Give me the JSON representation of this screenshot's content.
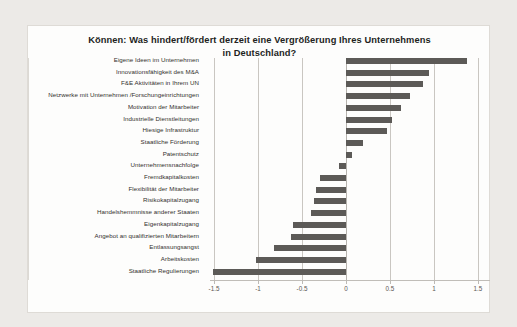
{
  "chart_data": {
    "type": "bar",
    "orientation": "horizontal",
    "title": "Können: Was hindert/fördert derzeit eine Vergrößerung Ihres Unternehmens in Deutschland?",
    "title_line1": "Können: Was hindert/fördert derzeit eine Vergrößerung Ihres Unternehmens",
    "title_line2": "in Deutschland?",
    "xlabel": "",
    "ylabel": "",
    "xlim": [
      -1.6,
      1.6
    ],
    "xticks": [
      -1.5,
      -1,
      -0.5,
      0,
      0.5,
      1,
      1.5
    ],
    "xtick_labels": [
      "-1.5",
      "-1",
      "-0.5",
      "0",
      "0.5",
      "1",
      "1.5"
    ],
    "grid": true,
    "legend": false,
    "bar_color": "#5c5a57",
    "categories": [
      "Eigene Ideen im Unternehmen",
      "Innovationsfähigkeit des M&A",
      "F&E Aktivitäten in Ihrem UN",
      "Netzwerke mit Unternehmen /Forschungeinrichtungen",
      "Motivation der Mitarbeiter",
      "Industrielle Dienstleitungen",
      "Hiesige Infrastruktur",
      "Staatliche Förderung",
      "Patentschutz",
      "Unternehmensnachfolge",
      "Fremdkapitalkosten",
      "Flexibilität der Mitarbeiter",
      "Risikokapitalzugang",
      "Handelshemmnisse anderer Staaten",
      "Eigenkapitalzugang",
      "Angebot an qualifizierten Mitarbeitern",
      "Entlassungsangst",
      "Arbeitskosten",
      "Staatliche Regulierungen"
    ],
    "values": [
      1.37,
      0.94,
      0.88,
      0.73,
      0.62,
      0.52,
      0.47,
      0.19,
      0.07,
      -0.08,
      -0.3,
      -0.34,
      -0.36,
      -0.4,
      -0.6,
      -0.62,
      -0.82,
      -1.02,
      -1.51
    ]
  }
}
